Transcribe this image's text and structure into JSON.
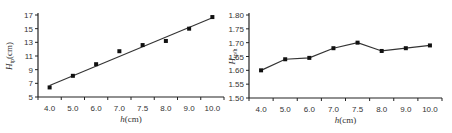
{
  "chart_data": [
    {
      "type": "scatter",
      "title": "",
      "xlabel": "h(cm)",
      "ylabel": "H_tp(cm)",
      "xlabel_italic_part": "h",
      "xlabel_unit": "(cm)",
      "ylabel_italic_part": "H",
      "ylabel_subscript": "tp",
      "ylabel_unit": "(cm)",
      "categories": [
        "4.0",
        "5.0",
        "6.0",
        "7.0",
        "7.5",
        "8.0",
        "9.0",
        "10.0"
      ],
      "x": [
        4.0,
        5.0,
        6.0,
        7.0,
        7.5,
        8.0,
        9.0,
        10.0
      ],
      "values": [
        6.4,
        8.1,
        9.8,
        11.7,
        12.6,
        13.2,
        15.0,
        16.7
      ],
      "trendline": {
        "type": "linear",
        "start": 6.7,
        "end": 16.6
      },
      "yticks": [
        "5",
        "7",
        "9",
        "11",
        "13",
        "15",
        "17"
      ],
      "ylim": [
        5,
        17
      ],
      "grid": false,
      "legend": null
    },
    {
      "type": "line",
      "title": "",
      "xlabel": "h(cm)",
      "ylabel": "H_tp/h",
      "xlabel_italic_part": "h",
      "xlabel_unit": "(cm)",
      "ylabel_italic_part": "H",
      "ylabel_subscript": "tp/h",
      "categories": [
        "4.0",
        "5.0",
        "6.0",
        "7.0",
        "7.5",
        "8.0",
        "9.0",
        "10.0"
      ],
      "x": [
        4.0,
        5.0,
        6.0,
        7.0,
        7.5,
        8.0,
        9.0,
        10.0
      ],
      "values": [
        1.6,
        1.64,
        1.645,
        1.68,
        1.7,
        1.67,
        1.68,
        1.69
      ],
      "yticks": [
        "1.50",
        "1.55",
        "1.60",
        "1.65",
        "1.70",
        "1.75",
        "1.80"
      ],
      "ylim": [
        1.5,
        1.8
      ],
      "grid": false,
      "legend": null
    }
  ],
  "colors": {
    "axis": "#222222",
    "series": "#333333",
    "text": "#333333"
  }
}
